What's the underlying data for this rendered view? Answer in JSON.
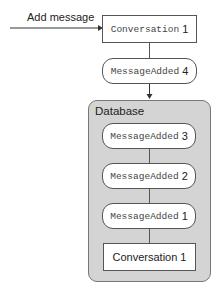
{
  "input_arrow": {
    "label": "Add message"
  },
  "top_entity": {
    "mono": "Conversation",
    "num": "1"
  },
  "pending_event": {
    "mono": "MessageAdded",
    "num": "4"
  },
  "database": {
    "title": "Database",
    "events": [
      {
        "mono": "MessageAdded",
        "num": "3"
      },
      {
        "mono": "MessageAdded",
        "num": "2"
      },
      {
        "mono": "MessageAdded",
        "num": "1"
      }
    ],
    "entity": {
      "label": "Conversation 1"
    }
  },
  "colors": {
    "database_fill": "#d4d4d4",
    "stroke": "#555555"
  }
}
